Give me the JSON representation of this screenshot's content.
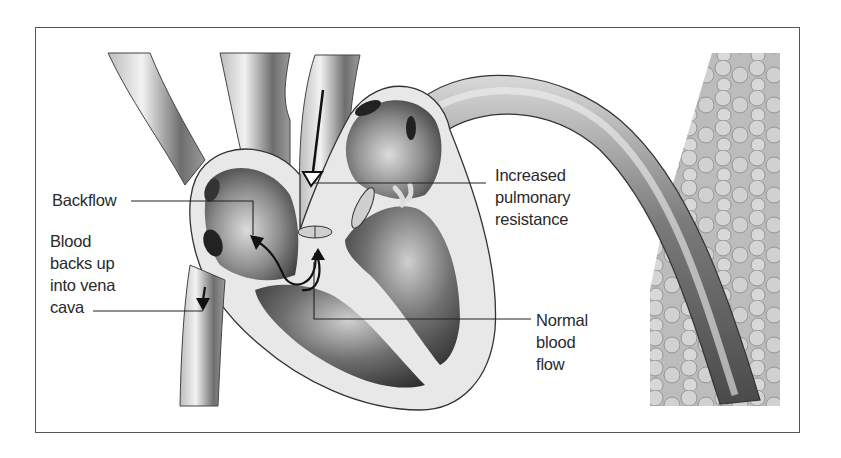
{
  "diagram": {
    "type": "anatomical-illustration",
    "labels": {
      "backflow": "Backflow",
      "blood_backs_up": [
        "Blood",
        "backs up",
        "into vena",
        "cava"
      ],
      "increased_pulmonary_resistance": [
        "Increased",
        "pulmonary",
        "resistance"
      ],
      "normal_blood_flow": [
        "Normal",
        "blood",
        "flow"
      ]
    },
    "colors": {
      "frame": "#555555",
      "leader_line": "#222222",
      "text": "#2a2a2a",
      "tissue_dark": "#3a3a3a",
      "tissue_mid": "#8a8a8a",
      "tissue_light": "#e6e6e6"
    }
  }
}
